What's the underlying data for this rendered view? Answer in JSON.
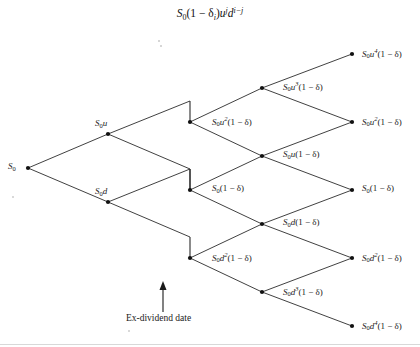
{
  "figure": {
    "title_plain": "S0(1 - δi)u^j d^(i-j)",
    "title_parts": {
      "s": "S",
      "s_sub": "0",
      "open": "(1 − δ",
      "delta_sub": "i",
      "close": ")",
      "u": "u",
      "u_sup": "j",
      "d": "d",
      "d_sup": "i−j"
    },
    "annotation": {
      "ex_dividend_label": "Ex-dividend date",
      "arrow": "up-arrow"
    },
    "type": "binomial-tree-diagram",
    "ink_color": "#2b2b2b",
    "background_color": "#ffffff"
  },
  "chart_data": {
    "type": "diagram",
    "xlabel": "",
    "ylabel": "",
    "grid": false,
    "legend": "none",
    "columns": 5,
    "nodes": [
      {
        "id": "n0",
        "label": "S0",
        "x": 28,
        "y": 168,
        "label_x": 8,
        "label_y": 162,
        "label_side": "left"
      },
      {
        "id": "n1u",
        "label": "S0u",
        "x": 108,
        "y": 134,
        "label_x": 95,
        "label_y": 119,
        "label_side": "above"
      },
      {
        "id": "n1d",
        "label": "S0d",
        "x": 108,
        "y": 202,
        "label_x": 95,
        "label_y": 187,
        "label_side": "above"
      },
      {
        "id": "n2a",
        "label": "S0u^2(1-δ)",
        "x": 190,
        "y": 122,
        "label_x": 212,
        "label_y": 116,
        "label_side": "right"
      },
      {
        "id": "n2b",
        "label": "S0(1-δ)",
        "x": 190,
        "y": 190,
        "label_x": 212,
        "label_y": 184,
        "label_side": "right"
      },
      {
        "id": "n2c",
        "label": "S0d^2(1-δ)",
        "x": 190,
        "y": 258,
        "label_x": 212,
        "label_y": 252,
        "label_side": "right"
      },
      {
        "id": "n3a",
        "label": "S0u^3(1-δ)",
        "x": 262,
        "y": 88,
        "label_x": 283,
        "label_y": 81,
        "label_side": "right"
      },
      {
        "id": "n3b",
        "label": "S0u(1-δ)",
        "x": 262,
        "y": 156,
        "label_x": 283,
        "label_y": 150,
        "label_side": "right"
      },
      {
        "id": "n3c",
        "label": "S0d(1-δ)",
        "x": 262,
        "y": 224,
        "label_x": 283,
        "label_y": 218,
        "label_side": "right"
      },
      {
        "id": "n3d",
        "label": "S0d^3(1-δ)",
        "x": 262,
        "y": 292,
        "label_x": 283,
        "label_y": 286,
        "label_side": "right"
      },
      {
        "id": "n4a",
        "label": "S0u^4(1-δ)",
        "x": 352,
        "y": 54,
        "label_x": 362,
        "label_y": 48,
        "label_side": "right"
      },
      {
        "id": "n4b",
        "label": "S0u^2(1-δ)",
        "x": 352,
        "y": 122,
        "label_x": 362,
        "label_y": 116,
        "label_side": "right"
      },
      {
        "id": "n4c",
        "label": "S0(1-δ)",
        "x": 352,
        "y": 190,
        "label_x": 362,
        "label_y": 184,
        "label_side": "right"
      },
      {
        "id": "n4d",
        "label": "S0d^2(1-δ)",
        "x": 352,
        "y": 258,
        "label_x": 362,
        "label_y": 252,
        "label_side": "right"
      },
      {
        "id": "n4e",
        "label": "S0d^4(1-δ)",
        "x": 352,
        "y": 326,
        "label_x": 362,
        "label_y": 320,
        "label_side": "right"
      }
    ],
    "node_labels": [
      "S0",
      "S0u",
      "S0d",
      "S0u^2(1-δ)",
      "S0(1-δ)",
      "S0d^2(1-δ)",
      "S0u^3(1-δ)",
      "S0u(1-δ)",
      "S0d(1-δ)",
      "S0d^3(1-δ)",
      "S0u^4(1-δ)",
      "S0u^2(1-δ)",
      "S0(1-δ)",
      "S0d^2(1-δ)",
      "S0d^4(1-δ)"
    ],
    "edges": [
      [
        "n0",
        "n1u"
      ],
      [
        "n0",
        "n1d"
      ],
      [
        "n1u",
        "n2a"
      ],
      [
        "n1u",
        "n2b"
      ],
      [
        "n1d",
        "n2b"
      ],
      [
        "n1d",
        "n2c"
      ],
      [
        "n2a",
        "n3a"
      ],
      [
        "n2a",
        "n3b"
      ],
      [
        "n2b",
        "n3b"
      ],
      [
        "n2b",
        "n3c"
      ],
      [
        "n2c",
        "n3c"
      ],
      [
        "n2c",
        "n3d"
      ],
      [
        "n3a",
        "n4a"
      ],
      [
        "n3a",
        "n4b"
      ],
      [
        "n3b",
        "n4b"
      ],
      [
        "n3b",
        "n4c"
      ],
      [
        "n3c",
        "n4c"
      ],
      [
        "n3c",
        "n4d"
      ],
      [
        "n3d",
        "n4d"
      ],
      [
        "n3d",
        "n4e"
      ]
    ],
    "ex_dividend_x": 190,
    "ex_dividend_drop": 21
  }
}
